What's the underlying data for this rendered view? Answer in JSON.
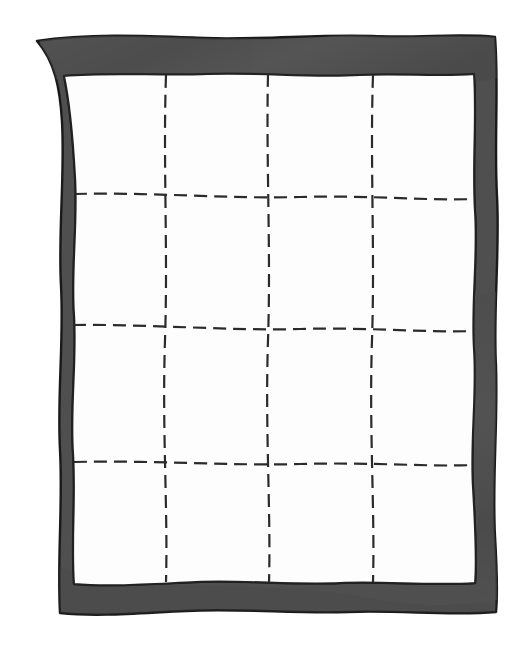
{
  "illustration": {
    "title": "Hand-drawn quilt with dashed stitching grid",
    "subject": "quilt",
    "style": "line drawing, hand-inked, flat fill",
    "canvas": {
      "width": 532,
      "height": 651,
      "background_color": "#ffffff"
    }
  },
  "colors": {
    "background": "#ffffff",
    "border_fill": "#4f4f4f",
    "border_fill_shadow": "#424242",
    "border_fill_highlight": "#5c5c5c",
    "ink_outline": "#1a1a1a",
    "panel_fill": "#fdfdfd",
    "panel_outline": "#222222",
    "stitch_line": "#2b2b2b"
  },
  "border": {
    "name": "quilt-binding",
    "label": "Binding border",
    "thickness_px": 38,
    "edge_style": "wavy hand-drawn",
    "outer_bounds": {
      "x": 33,
      "y": 33,
      "width": 464,
      "height": 580
    },
    "inner_bounds": {
      "x": 62,
      "y": 74,
      "width": 414,
      "height": 510
    }
  },
  "panel": {
    "name": "quilt-field",
    "label": "Quilt top panel",
    "fill": "#fdfdfd",
    "bounds": {
      "x": 62,
      "y": 74,
      "width": 414,
      "height": 510
    }
  },
  "stitching": {
    "name": "quilt-stitching",
    "label": "Dashed quilting stitch lines",
    "dash_length_px": 13,
    "gap_length_px": 7,
    "stroke_width_px": 2.2,
    "stroke_color": "#2b2b2b",
    "grid_rows": 4,
    "grid_cols": 4,
    "vertical_lines": [
      {
        "id": "v1",
        "x": 165
      },
      {
        "id": "v2",
        "x": 268
      },
      {
        "id": "v3",
        "x": 372
      }
    ],
    "horizontal_lines": [
      {
        "id": "h1",
        "y": 196
      },
      {
        "id": "h2",
        "y": 328
      },
      {
        "id": "h3",
        "y": 463
      }
    ]
  },
  "cells": {
    "name": "quilt-cells",
    "count": 16,
    "label": "Quilt blocks formed by the stitching grid"
  },
  "chart_data": {
    "type": "table",
    "title": "Hand-drawn quilt with dashed stitching grid",
    "xlabel": "",
    "ylabel": "",
    "categories": [
      "column 1",
      "column 2",
      "column 3",
      "column 4"
    ],
    "rows": [
      "row 1",
      "row 2",
      "row 3",
      "row 4"
    ],
    "values": [
      [
        1,
        1,
        1,
        1
      ],
      [
        1,
        1,
        1,
        1
      ],
      [
        1,
        1,
        1,
        1
      ],
      [
        1,
        1,
        1,
        1
      ]
    ],
    "grid": true,
    "legend": "none"
  }
}
